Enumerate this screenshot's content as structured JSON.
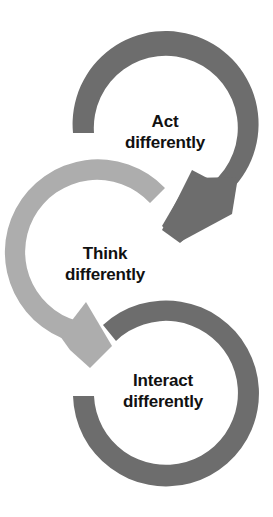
{
  "diagram": {
    "type": "cycle",
    "colors": {
      "dark_arrow": "#6d6d6d",
      "light_arrow": "#adadad",
      "text": "#111111",
      "background": "#ffffff"
    },
    "nodes": [
      {
        "line1": "Act",
        "line2": "differently",
        "arrow_color": "dark"
      },
      {
        "line1": "Think",
        "line2": "differently",
        "arrow_color": "light"
      },
      {
        "line1": "Interact",
        "line2": "differently",
        "arrow_color": "dark"
      }
    ],
    "flow": [
      "Act differently",
      "Think differently",
      "Interact differently"
    ]
  }
}
